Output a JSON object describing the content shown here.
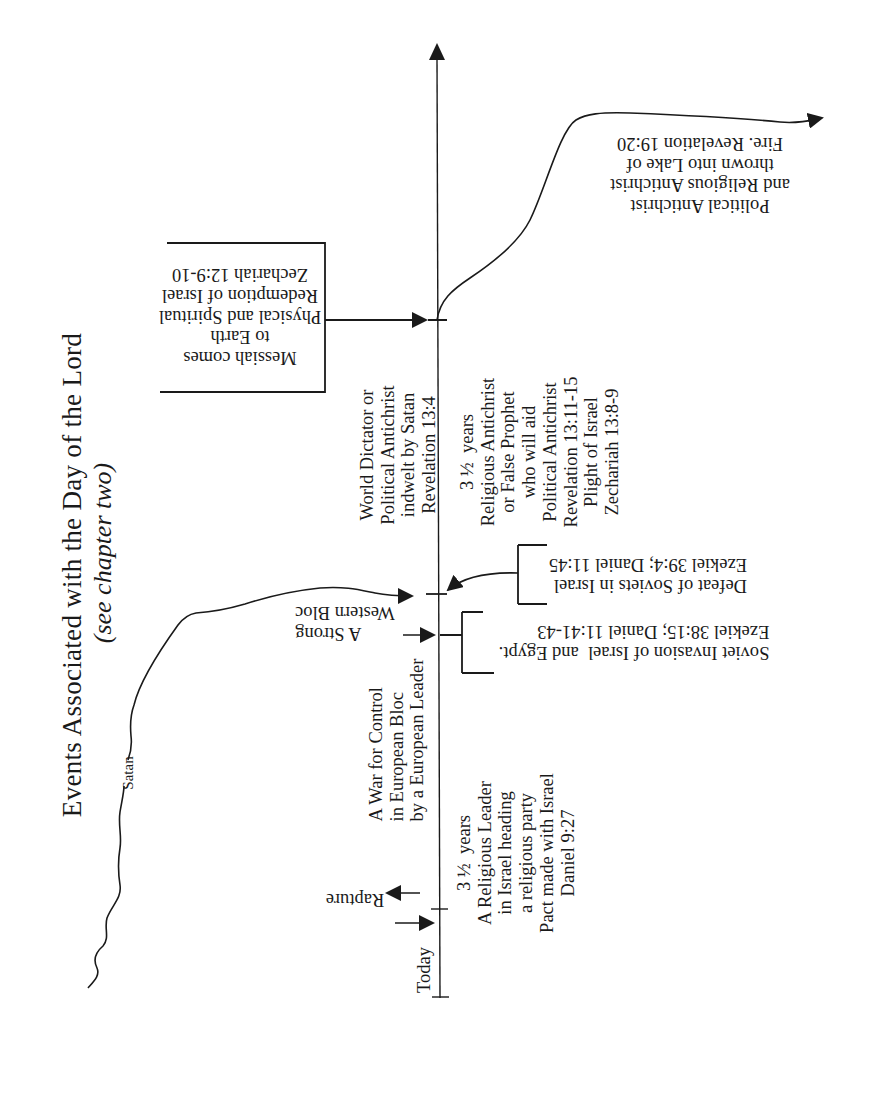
{
  "title": "Events Associated with the Day of the Lord",
  "subtitle": "(see chapter two)",
  "timeline": {
    "start_label": "Today",
    "markers": [
      "Rapture",
      "Mid-point",
      "Second Coming"
    ]
  },
  "labels": {
    "today": "Today",
    "rapture": "Rapture",
    "war_for_control": "A War for Control\nin European Bloc\nby a European Leader",
    "strong_western_bloc": "A Strong\nWestern Bloc",
    "first_half": "3 ½  years\nA Religious Leader\nin Israel heading\na religious party\nPact made with Israel\nDaniel 9:27",
    "soviet_invasion": "Soviet Invasion of Israel  and Egypt.\nEzekiel 38:15; Daniel 11:41-43",
    "defeat_of_soviets": "Defeat of Soviets in Israel\nEzekiel 39:4; Daniel 11:45",
    "world_dictator": "World Dictator or\nPolitical Antichrist\nindwelt by Satan\nRevelation 13:4",
    "second_half": "3 ½  years\nReligious Antichrist\nor False Prophet\nwho will aid\nPolitical Antichrist\nRevelation 13:11-15\nPlight of Israel\nZechariah 13:8-9",
    "messiah_comes": "Messiah comes\nto Earth\nPhysical and Spiritual\nRedemption of Israel\nZechariah 12:9-10",
    "lake_of_fire": "Political Antichrist\nand Religious Antichrist\nthrown into Lake of\nFire. Revelation 19:20",
    "satan": "Satan"
  },
  "colors": {
    "ink": "#1a1a1a",
    "paper": "#ffffff"
  }
}
